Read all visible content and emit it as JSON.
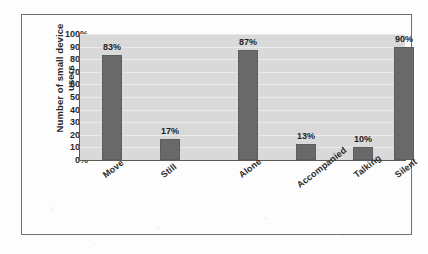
{
  "chart_data": {
    "type": "bar",
    "title": "",
    "subtitle": "",
    "xlabel": "",
    "ylabel": "Number of small device users",
    "categories": [
      "Move",
      "Still",
      "Alone",
      "Accompanied",
      "Talking",
      "Silent"
    ],
    "values": [
      83,
      17,
      87,
      13,
      10,
      90
    ],
    "value_labels": [
      "83%",
      "17%",
      "87%",
      "13%",
      "10%",
      "90%"
    ],
    "ylim": [
      0,
      100
    ],
    "ytick_labels": [
      "100%",
      "90%",
      "80%",
      "70%",
      "60%",
      "50%",
      "40%",
      "30%",
      "20%",
      "10%",
      "0%"
    ],
    "ytick_values": [
      100,
      90,
      80,
      70,
      60,
      50,
      40,
      30,
      20,
      10,
      0
    ],
    "grid": true,
    "legend": false,
    "legend_position": "none",
    "series": [
      {
        "name": "Number of small device users",
        "values": [
          83,
          17,
          87,
          13,
          10,
          90
        ]
      }
    ],
    "colors": {
      "bar_fill": "#696969",
      "bar_edge": "#5d5d5d",
      "plot_background": "#d9d9d9",
      "figure_background": "#fdfdfd",
      "frame_border": "#6f6f6f",
      "axis_line": "#5a5a5a",
      "text": "#2a2a2a",
      "gridline": "#ffffff"
    }
  },
  "page_artifacts": {
    "ghost_a": "",
    "ghost_b": "",
    "ghost_c": "",
    "ghost_d": "",
    "ghost_e": "",
    "ghost_f": "",
    "ghost_g": ""
  }
}
